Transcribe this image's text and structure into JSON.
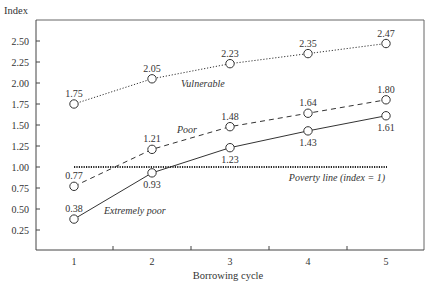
{
  "chart_data": {
    "type": "line",
    "title": "",
    "xlabel": "Borrowing cycle",
    "ylabel": "Index",
    "x": [
      1,
      2,
      3,
      4,
      5
    ],
    "xticks": [
      "1",
      "2",
      "3",
      "4",
      "5"
    ],
    "yticks": [
      "0.25",
      "0.50",
      "0.75",
      "1.00",
      "1.25",
      "1.50",
      "1.75",
      "2.00",
      "2.25",
      "2.50"
    ],
    "ylim": [
      0,
      2.75
    ],
    "grid": false,
    "series": [
      {
        "name": "Vulnerable",
        "style": "dotted",
        "values": [
          1.75,
          2.05,
          2.23,
          2.35,
          2.47
        ],
        "labels": [
          "1.75",
          "2.05",
          "2.23",
          "2.35",
          "2.47"
        ],
        "label_pos": [
          "above",
          "above",
          "above",
          "above",
          "above"
        ]
      },
      {
        "name": "Poor",
        "style": "dashed",
        "values": [
          0.77,
          1.21,
          1.48,
          1.64,
          1.8
        ],
        "labels": [
          "0.77",
          "1.21",
          "1.48",
          "1.64",
          "1.80"
        ],
        "label_pos": [
          "above",
          "above",
          "above",
          "above",
          "above"
        ]
      },
      {
        "name": "Extremely poor",
        "style": "solid",
        "values": [
          0.38,
          0.93,
          1.23,
          1.43,
          1.61
        ],
        "labels": [
          "0.38",
          "0.93",
          "1.23",
          "1.43",
          "1.61"
        ],
        "label_pos": [
          "above",
          "below",
          "below",
          "below",
          "below"
        ]
      }
    ],
    "annotations": [
      {
        "text": "Poverty line (index = 1)",
        "type": "hline",
        "y": 1.0,
        "style": "dotted"
      }
    ]
  },
  "labels": {
    "ylabel": "Index",
    "xlabel": "Borrowing cycle",
    "vulnerable": "Vulnerable",
    "poor": "Poor",
    "extremely_poor": "Extremely poor",
    "poverty_line": "Poverty line (index = 1)"
  },
  "colors": {
    "line": "#333333",
    "frame": "#555555",
    "marker_fill": "#ffffff"
  }
}
